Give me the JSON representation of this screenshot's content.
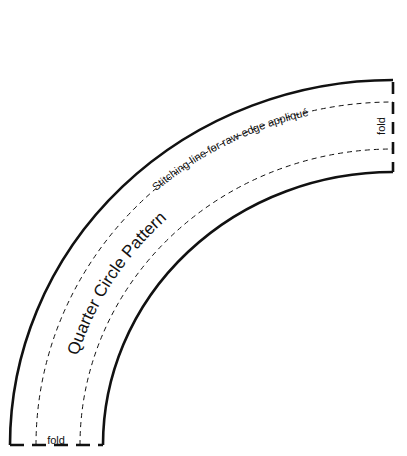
{
  "title": "Quarter Circle Pattern",
  "stitch_label": "Stitching line for raw-edge appliqué",
  "fold_right": "fold",
  "fold_bottom": "fold",
  "colors": {
    "line": "#111111",
    "background": "#ffffff"
  }
}
